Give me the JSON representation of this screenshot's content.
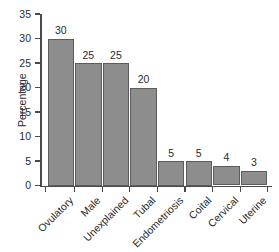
{
  "chart_data": {
    "type": "bar",
    "title": "",
    "xlabel": "",
    "ylabel": "Percentage",
    "ylim": [
      0,
      35
    ],
    "yticks": [
      0,
      5,
      10,
      15,
      20,
      25,
      30,
      35
    ],
    "ytick_labels": [
      "0",
      "5",
      "10",
      "15",
      "20",
      "25",
      "30",
      "35"
    ],
    "grid": false,
    "legend": false,
    "categories": [
      "Ovulatory",
      "Male",
      "Unexplained",
      "Tubal",
      "Endometriosis",
      "Coital",
      "Cervical",
      "Uterine"
    ],
    "values": [
      30,
      25,
      25,
      20,
      5,
      5,
      4,
      3
    ],
    "value_labels": [
      "30",
      "25",
      "25",
      "20",
      "5",
      "5",
      "4",
      "3"
    ],
    "bar_fill_color": "#8d8d8d",
    "bar_edge_color": "#5c5c5c",
    "axis_color": "#4a4a4a",
    "text_color": "#2b2b2b",
    "background_color": "#ffffff"
  }
}
